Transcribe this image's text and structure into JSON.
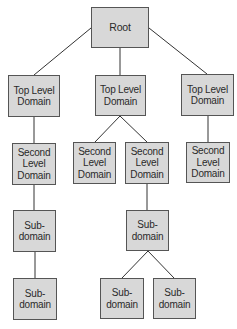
{
  "diagram": {
    "colors": {
      "box_fill": "#d8d8d8",
      "box_border": "#555555",
      "line": "#333333",
      "text": "#2a2a2a",
      "background": "#ffffff"
    },
    "nodes": {
      "root": {
        "label": "Root"
      },
      "tld_left": {
        "label": "Top Level\nDomain"
      },
      "tld_middle": {
        "label": "Top Level\nDomain"
      },
      "tld_right": {
        "label": "Top Level\nDomain"
      },
      "sld_left": {
        "label": "Second\nLevel\nDomain"
      },
      "sld_middle_left": {
        "label": "Second\nLevel\nDomain"
      },
      "sld_middle_right": {
        "label": "Second\nLevel\nDomain"
      },
      "sld_right": {
        "label": "Second\nLevel\nDomain"
      },
      "sub_left_1": {
        "label": "Sub-\ndomain"
      },
      "sub_left_2": {
        "label": "Sub-\ndomain"
      },
      "sub_middle": {
        "label": "Sub-\ndomain"
      },
      "sub_middle_left": {
        "label": "Sub-\ndomain"
      },
      "sub_middle_right": {
        "label": "Sub-\ndomain"
      }
    },
    "edges": [
      {
        "from": "root",
        "to": "tld_left"
      },
      {
        "from": "root",
        "to": "tld_middle"
      },
      {
        "from": "root",
        "to": "tld_right"
      },
      {
        "from": "tld_left",
        "to": "sld_left"
      },
      {
        "from": "tld_middle",
        "to": "sld_middle_left"
      },
      {
        "from": "tld_middle",
        "to": "sld_middle_right"
      },
      {
        "from": "tld_right",
        "to": "sld_right"
      },
      {
        "from": "sld_left",
        "to": "sub_left_1"
      },
      {
        "from": "sub_left_1",
        "to": "sub_left_2"
      },
      {
        "from": "sld_middle_right",
        "to": "sub_middle"
      },
      {
        "from": "sub_middle",
        "to": "sub_middle_left"
      },
      {
        "from": "sub_middle",
        "to": "sub_middle_right"
      }
    ]
  }
}
